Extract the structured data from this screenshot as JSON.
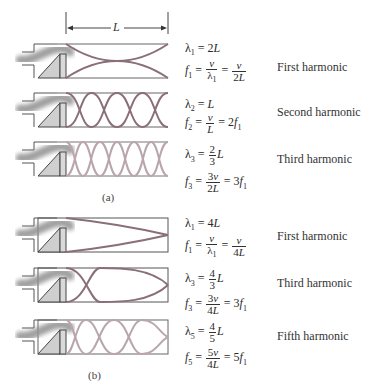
{
  "dimension": {
    "label": "L"
  },
  "part_a": {
    "caption": "(a)",
    "title": "Open–open pipe",
    "rows": [
      {
        "name": "First harmonic",
        "lambda": "λ1 = 2L",
        "freq": "f1 = v/λ1 = v/2L",
        "wave_color": "#8a6f78"
      },
      {
        "name": "Second harmonic",
        "lambda": "λ2 = L",
        "freq": "f2 = v/L = 2f1",
        "wave_color": "#8a6f78"
      },
      {
        "name": "Third harmonic",
        "lambda": "λ3 = 2/3 L",
        "freq": "f3 = 3v/2L = 3f1",
        "wave_color": "#b9a6ad"
      }
    ]
  },
  "part_b": {
    "caption": "(b)",
    "title": "Open–closed pipe",
    "rows": [
      {
        "name": "First harmonic",
        "lambda": "λ1 = 4L",
        "freq": "f1 = v/λ1 = v/4L",
        "wave_color": "#8a6f78"
      },
      {
        "name": "Third harmonic",
        "lambda": "λ3 = 4/3 L",
        "freq": "f3 = 3v/4L = 3f1",
        "wave_color": "#8a6f78"
      },
      {
        "name": "Fifth harmonic",
        "lambda": "λ5 = 4/5 L",
        "freq": "f5 = 5v/4L = 5f1",
        "wave_color": "#b9a6ad"
      }
    ]
  },
  "labels": {
    "a1": "First harmonic",
    "a2": "Second harmonic",
    "a3": "Third harmonic",
    "b1": "First harmonic",
    "b3": "Third harmonic",
    "b5": "Fifth harmonic",
    "cap_a": "(a)",
    "cap_b": "(b)",
    "L": "L"
  }
}
